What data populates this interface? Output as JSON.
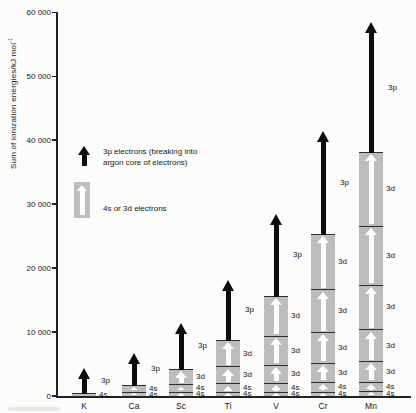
{
  "y_axis": {
    "label": "Sum of ionization energies/kJ mol",
    "label_superscript": "-1",
    "ticks": [
      {
        "value": 60000,
        "label": "60 000"
      },
      {
        "value": 50000,
        "label": "50 000"
      },
      {
        "value": 40000,
        "label": "40 000"
      },
      {
        "value": 30000,
        "label": "30 000"
      },
      {
        "value": 20000,
        "label": "20 000"
      },
      {
        "value": 10000,
        "label": "10 000"
      },
      {
        "value": 0,
        "label": "0"
      }
    ]
  },
  "legend": {
    "black_arrow_label_line1": "3p electrons (breaking into",
    "black_arrow_label_line2": "argon core of electrons)",
    "gray_bar_label": "4s or 3d electrons"
  },
  "chart_data": {
    "type": "bar",
    "subtype": "stacked-segments-with-arrows",
    "title": "",
    "xlabel": "",
    "ylabel": "Sum of ionization energies/kJ mol-1",
    "ylim": [
      0,
      60000
    ],
    "grid": false,
    "categories": [
      "K",
      "Ca",
      "Sc",
      "Ti",
      "V",
      "Cr",
      "Mn"
    ],
    "elements": [
      {
        "symbol": "K",
        "segments": [
          {
            "orbital": "4s",
            "energy": 420
          }
        ],
        "cumulative_total": 420,
        "arrow": {
          "label": "3p",
          "extends_to": 4400
        }
      },
      {
        "symbol": "Ca",
        "segments": [
          {
            "orbital": "4s",
            "energy": 590
          },
          {
            "orbital": "4s",
            "energy": 1145
          }
        ],
        "cumulative_total": 1735,
        "arrow": {
          "label": "3p",
          "extends_to": 6700
        }
      },
      {
        "symbol": "Sc",
        "segments": [
          {
            "orbital": "4s",
            "energy": 633
          },
          {
            "orbital": "4s",
            "energy": 1235
          },
          {
            "orbital": "3d",
            "energy": 2389
          }
        ],
        "cumulative_total": 4257,
        "arrow": {
          "label": "3p",
          "extends_to": 11400
        }
      },
      {
        "symbol": "Ti",
        "segments": [
          {
            "orbital": "4s",
            "energy": 659
          },
          {
            "orbital": "4s",
            "energy": 1310
          },
          {
            "orbital": "3d",
            "energy": 2653
          },
          {
            "orbital": "3d",
            "energy": 4175
          }
        ],
        "cumulative_total": 8797,
        "arrow": {
          "label": "3p",
          "extends_to": 18200
        }
      },
      {
        "symbol": "V",
        "segments": [
          {
            "orbital": "4s",
            "energy": 651
          },
          {
            "orbital": "4s",
            "energy": 1414
          },
          {
            "orbital": "3d",
            "energy": 2830
          },
          {
            "orbital": "3d",
            "energy": 4507
          },
          {
            "orbital": "3d",
            "energy": 6299
          }
        ],
        "cumulative_total": 15701,
        "arrow": {
          "label": "3p",
          "extends_to": 28400
        }
      },
      {
        "symbol": "Cr",
        "segments": [
          {
            "orbital": "4s",
            "energy": 653
          },
          {
            "orbital": "4s",
            "energy": 1591
          },
          {
            "orbital": "3d",
            "energy": 2987
          },
          {
            "orbital": "3d",
            "energy": 4740
          },
          {
            "orbital": "3d",
            "energy": 6690
          },
          {
            "orbital": "3d",
            "energy": 8740
          }
        ],
        "cumulative_total": 25401,
        "arrow": {
          "label": "3p",
          "extends_to": 41400
        }
      },
      {
        "symbol": "Mn",
        "segments": [
          {
            "orbital": "4s",
            "energy": 717
          },
          {
            "orbital": "4s",
            "energy": 1509
          },
          {
            "orbital": "3d",
            "energy": 3248
          },
          {
            "orbital": "3d",
            "energy": 4940
          },
          {
            "orbital": "3d",
            "energy": 6990
          },
          {
            "orbital": "3d",
            "energy": 9220
          },
          {
            "orbital": "3d",
            "energy": 11500
          }
        ],
        "cumulative_total": 38124,
        "arrow": {
          "label": "3p",
          "extends_to": 58500
        }
      }
    ],
    "legend_position": "upper-left-inside"
  },
  "colors": {
    "background": "#fcfcfa",
    "bar_gray": "#bdbdbd",
    "divider": "#2e2e2e",
    "black": "#0d0d0d",
    "white_arrow": "#ffffff",
    "axis": "#222222",
    "text": "#161616"
  }
}
